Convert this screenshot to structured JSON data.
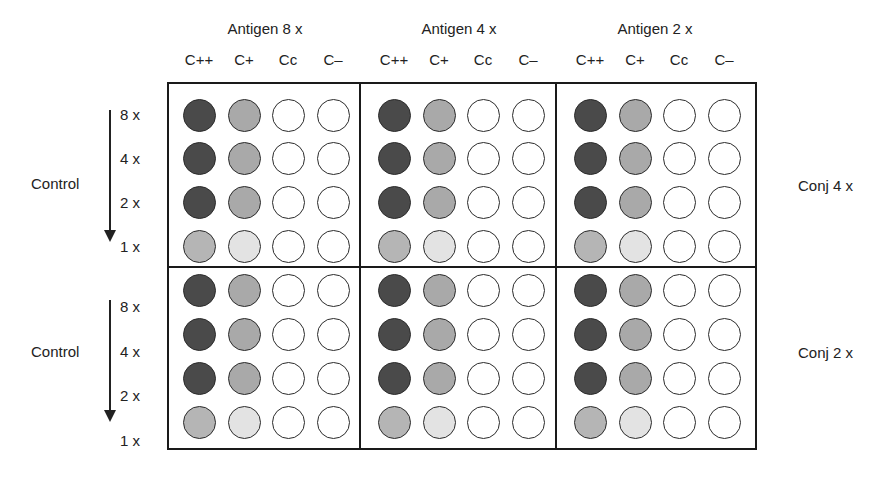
{
  "diagram": {
    "type": "well-plate-matrix",
    "antigen_groups": [
      {
        "label": "Antigen 8 x"
      },
      {
        "label": "Antigen 4 x"
      },
      {
        "label": "Antigen 2 x"
      }
    ],
    "columns": [
      "C++",
      "C+",
      "Cc",
      "C–"
    ],
    "panels": [
      {
        "left_label": "Control",
        "right_label": "Conj 4 x",
        "row_labels": [
          "8 x",
          "4 x",
          "2 x",
          "1 x"
        ]
      },
      {
        "left_label": "Control",
        "right_label": "Conj 2 x",
        "row_labels": [
          "8 x",
          "4 x",
          "2 x",
          "1 x"
        ]
      }
    ],
    "well_pattern": [
      [
        "dark",
        "medium",
        "empty",
        "empty"
      ],
      [
        "dark",
        "medium",
        "empty",
        "empty"
      ],
      [
        "dark",
        "medium",
        "empty",
        "empty"
      ],
      [
        "light",
        "pale",
        "empty",
        "empty"
      ]
    ],
    "colors": {
      "dark": "#4a4a4a",
      "medium": "#a9a9a9",
      "light": "#b5b5b5",
      "pale": "#e3e3e3",
      "empty": "#ffffff",
      "frame": "#1a1a1a"
    }
  }
}
